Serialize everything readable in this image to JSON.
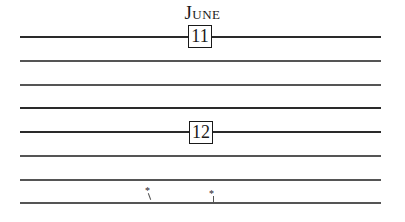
{
  "page": {
    "month": "June",
    "days": [
      {
        "label": "11"
      },
      {
        "label": "12"
      }
    ],
    "marks": [
      {
        "glyph": "*"
      },
      {
        "glyph": "*"
      }
    ]
  }
}
